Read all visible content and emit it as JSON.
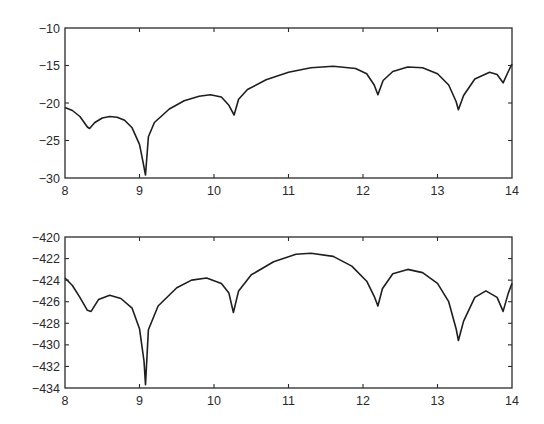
{
  "chart_data": [
    {
      "type": "line",
      "title": "",
      "xlabel": "",
      "ylabel": "",
      "xlim": [
        8,
        14
      ],
      "ylim": [
        -30,
        -10
      ],
      "xticks": [
        "8",
        "9",
        "10",
        "11",
        "12",
        "13",
        "14"
      ],
      "yticks": [
        "-10",
        "-15",
        "-20",
        "-25",
        "-30"
      ],
      "ytick_labels": [
        "−10",
        "−15",
        "−20",
        "−25",
        "−30"
      ],
      "grid": false,
      "legend": null,
      "color": "#1e1e1e",
      "series": [
        {
          "name": "top",
          "x": [
            8.0,
            8.1,
            8.2,
            8.3,
            8.33,
            8.4,
            8.5,
            8.6,
            8.7,
            8.8,
            8.9,
            9.0,
            9.04,
            9.08,
            9.12,
            9.2,
            9.4,
            9.6,
            9.8,
            9.95,
            10.1,
            10.2,
            10.27,
            10.33,
            10.45,
            10.7,
            11.0,
            11.3,
            11.6,
            11.9,
            12.05,
            12.15,
            12.2,
            12.27,
            12.4,
            12.6,
            12.8,
            13.0,
            13.15,
            13.25,
            13.28,
            13.35,
            13.5,
            13.7,
            13.8,
            13.88,
            13.95,
            14.0
          ],
          "y": [
            -20.6,
            -21.0,
            -21.8,
            -23.2,
            -23.4,
            -22.6,
            -22.0,
            -21.8,
            -21.9,
            -22.3,
            -23.3,
            -25.5,
            -27.5,
            -29.6,
            -24.5,
            -22.6,
            -20.8,
            -19.7,
            -19.1,
            -18.9,
            -19.2,
            -20.3,
            -21.6,
            -19.5,
            -18.2,
            -16.9,
            -15.9,
            -15.3,
            -15.1,
            -15.4,
            -16.1,
            -17.6,
            -18.9,
            -17.0,
            -15.8,
            -15.2,
            -15.3,
            -16.1,
            -17.6,
            -19.8,
            -20.9,
            -19.0,
            -16.8,
            -15.9,
            -16.2,
            -17.3,
            -15.8,
            -14.8
          ]
        }
      ]
    },
    {
      "type": "line",
      "title": "",
      "xlabel": "",
      "ylabel": "",
      "xlim": [
        8,
        14
      ],
      "ylim": [
        -434,
        -420
      ],
      "xticks": [
        "8",
        "9",
        "10",
        "11",
        "12",
        "13",
        "14"
      ],
      "yticks": [
        "-420",
        "-422",
        "-424",
        "-426",
        "-428",
        "-430",
        "-432",
        "-434"
      ],
      "ytick_labels": [
        "−420",
        "−422",
        "−424",
        "−426",
        "−428",
        "−430",
        "−432",
        "−434"
      ],
      "grid": false,
      "legend": null,
      "color": "#1e1e1e",
      "series": [
        {
          "name": "bottom",
          "x": [
            8.0,
            8.1,
            8.2,
            8.3,
            8.35,
            8.45,
            8.6,
            8.75,
            8.9,
            9.0,
            9.06,
            9.08,
            9.12,
            9.25,
            9.5,
            9.7,
            9.9,
            10.1,
            10.2,
            10.26,
            10.33,
            10.5,
            10.8,
            11.1,
            11.3,
            11.6,
            11.85,
            12.05,
            12.15,
            12.2,
            12.26,
            12.4,
            12.6,
            12.8,
            13.0,
            13.15,
            13.25,
            13.28,
            13.35,
            13.5,
            13.65,
            13.8,
            13.88,
            13.95,
            14.0
          ],
          "y": [
            -423.8,
            -424.5,
            -425.6,
            -426.8,
            -426.9,
            -425.8,
            -425.4,
            -425.7,
            -426.6,
            -428.5,
            -431.5,
            -433.7,
            -428.6,
            -426.4,
            -424.7,
            -424.0,
            -423.8,
            -424.3,
            -425.2,
            -427.0,
            -425.0,
            -423.5,
            -422.3,
            -421.6,
            -421.5,
            -421.8,
            -422.7,
            -424.1,
            -425.5,
            -426.4,
            -424.8,
            -423.4,
            -423.0,
            -423.3,
            -424.3,
            -426.0,
            -428.5,
            -429.6,
            -427.8,
            -425.6,
            -425.0,
            -425.6,
            -426.9,
            -425.2,
            -424.3
          ]
        }
      ]
    }
  ]
}
